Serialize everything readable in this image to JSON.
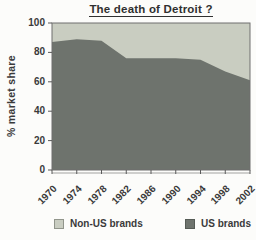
{
  "chart_data": {
    "type": "area",
    "stacked": true,
    "title": "The death of Detroit ?",
    "ylabel": "% market share",
    "ylim": [
      0,
      100
    ],
    "y_ticks": [
      100,
      80,
      60,
      40,
      20,
      0
    ],
    "x": [
      1970,
      1974,
      1978,
      1982,
      1986,
      1990,
      1994,
      1998,
      2002
    ],
    "series": [
      {
        "name": "US brands",
        "values": [
          87,
          89,
          88,
          76,
          76,
          76,
          75,
          67,
          61
        ],
        "color": "#6e736d"
      },
      {
        "name": "Non-US brands",
        "values": [
          13,
          11,
          12,
          24,
          24,
          24,
          25,
          33,
          39
        ],
        "color": "#c9cdc1"
      }
    ],
    "legend": [
      {
        "label": "Non-US brands",
        "color": "#c9cdc1"
      },
      {
        "label": "US brands",
        "color": "#6e736d"
      }
    ],
    "legend_position": "bottom",
    "grid": false,
    "colors": {
      "plot_border": "#6f6f6f",
      "axis": "#5a5a5a",
      "text": "#3a3a3a"
    }
  }
}
